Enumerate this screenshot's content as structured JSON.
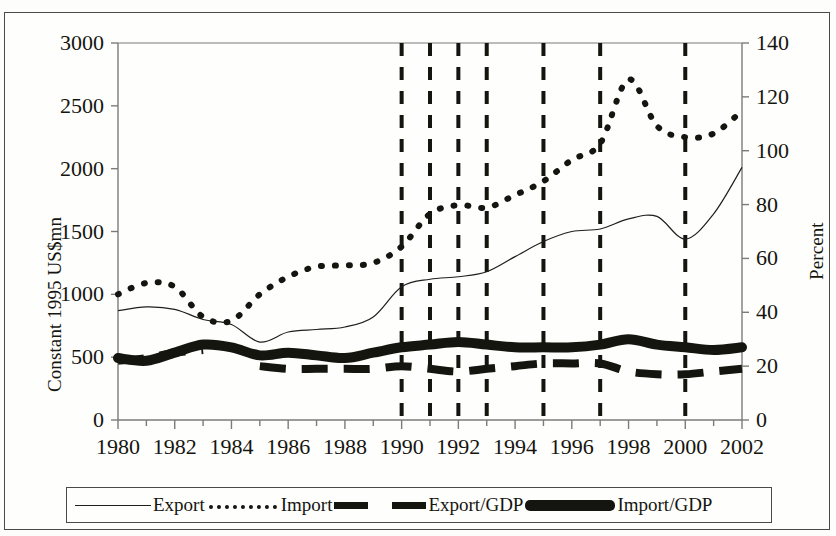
{
  "figure": {
    "name": "trade-chart",
    "background": "#fdfdfc",
    "border_color": "#4a4a48"
  },
  "chart_data": {
    "type": "line",
    "title": "",
    "xlabel": "",
    "ylabel": "Constant 1995 US$mn",
    "y2label": "Percent",
    "xlim": [
      1980,
      2002
    ],
    "ylim": [
      0,
      3000
    ],
    "y2lim": [
      0,
      140
    ],
    "ytick_step": 500,
    "y2tick_step": 20,
    "xtick_step": 2,
    "minor_xtick_step": 1,
    "grid": false,
    "legend_position": "below",
    "x": [
      1980,
      1981,
      1982,
      1983,
      1984,
      1985,
      1986,
      1987,
      1988,
      1989,
      1990,
      1991,
      1992,
      1993,
      1994,
      1995,
      1996,
      1997,
      1998,
      1999,
      2000,
      2001,
      2002
    ],
    "xticklabels": [
      "1980",
      "1982",
      "1984",
      "1986",
      "1988",
      "1990",
      "1992",
      "1994",
      "1996",
      "1998",
      "2000",
      "2002"
    ],
    "yticklabels": [
      "0",
      "500",
      "1000",
      "1500",
      "2000",
      "2500",
      "3000"
    ],
    "y2ticklabels": [
      "0",
      "20",
      "40",
      "60",
      "80",
      "100",
      "120",
      "140"
    ],
    "series": [
      {
        "name": "Export",
        "axis": "left",
        "style": "thin-solid",
        "color": "#201f1b",
        "width": 1.2,
        "values": [
          870,
          900,
          880,
          800,
          760,
          620,
          700,
          720,
          740,
          820,
          1060,
          1120,
          1140,
          1180,
          1300,
          1420,
          1500,
          1520,
          1600,
          1620,
          1440,
          1640,
          2010
        ]
      },
      {
        "name": "Import",
        "axis": "left",
        "style": "dotted",
        "color": "#15150f",
        "width": 6,
        "values": [
          1000,
          1090,
          1060,
          820,
          790,
          1000,
          1140,
          1220,
          1230,
          1250,
          1380,
          1640,
          1710,
          1690,
          1790,
          1900,
          2070,
          2200,
          2710,
          2340,
          2250,
          2280,
          2460
        ]
      },
      {
        "name": "Export/GDP",
        "axis": "right",
        "style": "thick-dashed",
        "color": "#15150f",
        "width": 8,
        "values": [
          22,
          23,
          25,
          26,
          null,
          20,
          19,
          19,
          19,
          19,
          20,
          19,
          18,
          19,
          20,
          21,
          21,
          21,
          18,
          17,
          17,
          18,
          19
        ]
      },
      {
        "name": "Import/GDP",
        "axis": "right",
        "style": "thick-solid",
        "color": "#15150f",
        "width": 10,
        "values": [
          23,
          22,
          25,
          28,
          27,
          24,
          25,
          24,
          23,
          25,
          27,
          28,
          29,
          28,
          27,
          27,
          27,
          28,
          30,
          28,
          27,
          26,
          27
        ]
      }
    ],
    "vertical_markers": {
      "style": "dashed",
      "color": "#15150f",
      "width": 4,
      "years": [
        1990,
        1991,
        1992,
        1993,
        1995,
        1997,
        2000
      ]
    }
  },
  "axes": {
    "left_title": "Constant 1995 US$mn",
    "right_title": "Percent"
  },
  "legend": {
    "items": [
      {
        "label": "Export",
        "swatch": "thin-line-swatch"
      },
      {
        "label": "Import",
        "swatch": "dotted-line-swatch"
      },
      {
        "label": "Export/GDP",
        "swatch": "thick-dashed-swatch"
      },
      {
        "label": "Import/GDP",
        "swatch": "thick-solid-swatch"
      }
    ]
  }
}
